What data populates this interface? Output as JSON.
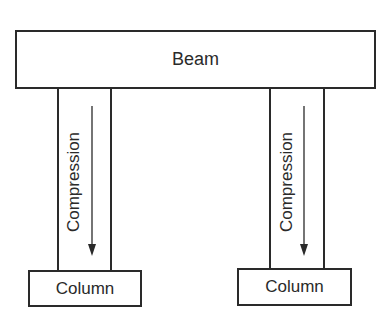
{
  "diagram": {
    "beam": {
      "label": "Beam"
    },
    "columns": [
      {
        "label": "Column",
        "force_label": "Compression",
        "force_direction": "down"
      },
      {
        "label": "Column",
        "force_label": "Compression",
        "force_direction": "down"
      }
    ],
    "colors": {
      "stroke": "#2a2a2a",
      "background": "#ffffff"
    }
  }
}
